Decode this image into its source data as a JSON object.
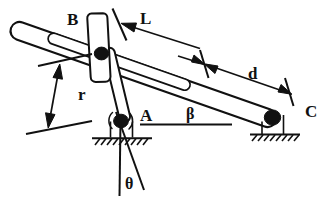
{
  "figure": {
    "kind": "engineering-mechanism-diagram",
    "background_color": "#ffffff",
    "ink_color": "#111111"
  },
  "labels": {
    "slider_B": "B",
    "pivot_A": "A",
    "pivot_C": "C",
    "length_L": "L",
    "length_d": "d",
    "radius_r": "r",
    "angle_beta": "β",
    "angle_theta": "θ"
  },
  "parts": [
    {
      "id": "main-bar",
      "name": "slotted main bar",
      "from": "upper-left",
      "to": "pivot C"
    },
    {
      "id": "slot",
      "name": "inner slot of main bar"
    },
    {
      "id": "crank",
      "name": "crank link",
      "from": "pivot A",
      "to": "slider B"
    },
    {
      "id": "slider",
      "name": "slider block B"
    },
    {
      "id": "joint-a",
      "name": "ground pivot A"
    },
    {
      "id": "joint-b",
      "name": "pin joint B"
    },
    {
      "id": "joint-c",
      "name": "ground pivot C"
    },
    {
      "id": "ground-left",
      "name": "left ground support with hatching"
    },
    {
      "id": "ground-right",
      "name": "right ground support with hatching"
    }
  ],
  "dimensions": [
    {
      "symbol": "L",
      "name": "distance-L",
      "style": "single-arrow-to-tick",
      "measures": "from slider B along bar"
    },
    {
      "symbol": "d",
      "name": "distance-d",
      "style": "double-arrow-between-ticks",
      "measures": "bar segment toward C"
    },
    {
      "symbol": "r",
      "name": "radius-r",
      "style": "double-arrow-between-ticks",
      "measures": "crank radius A to B"
    }
  ],
  "angles": [
    {
      "symbol": "β",
      "name": "angle-beta",
      "between": "horizontal reference line and main bar",
      "vertex": "A"
    },
    {
      "symbol": "θ",
      "name": "angle-theta",
      "between": "vertical reference line and crank extension",
      "vertex": "A"
    }
  ]
}
